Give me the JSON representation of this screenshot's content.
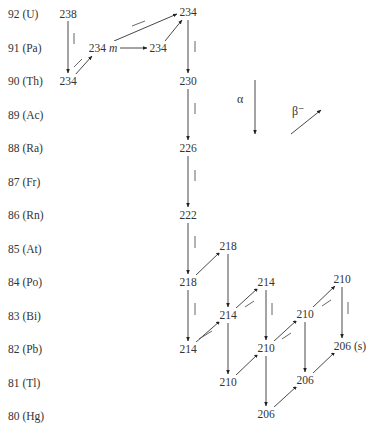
{
  "rows": [
    {
      "label": "92 (U)",
      "y": 14
    },
    {
      "label": "91 (Pa)",
      "y": 48
    },
    {
      "label": "90 (Th)",
      "y": 81
    },
    {
      "label": "89 (Ac)",
      "y": 115
    },
    {
      "label": "88 (Ra)",
      "y": 148
    },
    {
      "label": "87 (Fr)",
      "y": 182
    },
    {
      "label": "86 (Rn)",
      "y": 215
    },
    {
      "label": "85 (At)",
      "y": 249
    },
    {
      "label": "84 (Po)",
      "y": 282
    },
    {
      "label": "83 (Bi)",
      "y": 316
    },
    {
      "label": "82 (Pb)",
      "y": 349
    },
    {
      "label": "81 (Tl)",
      "y": 383
    },
    {
      "label": "80 (Hg)",
      "y": 416
    }
  ],
  "nodes": {
    "u238": {
      "label": "238",
      "x": 68,
      "y": 14
    },
    "th234": {
      "label": "234",
      "x": 68,
      "y": 81
    },
    "pa234m": {
      "label": "234 m",
      "x": 103,
      "y": 48
    },
    "pa234": {
      "label": "234",
      "x": 158,
      "y": 48
    },
    "u234": {
      "label": "234",
      "x": 188,
      "y": 12
    },
    "th230": {
      "label": "230",
      "x": 188,
      "y": 81
    },
    "ra226": {
      "label": "226",
      "x": 188,
      "y": 148
    },
    "rn222": {
      "label": "222",
      "x": 188,
      "y": 215
    },
    "po218": {
      "label": "218",
      "x": 188,
      "y": 282
    },
    "at218": {
      "label": "218",
      "x": 228,
      "y": 246
    },
    "pb214": {
      "label": "214",
      "x": 188,
      "y": 349
    },
    "bi214": {
      "label": "214",
      "x": 228,
      "y": 315
    },
    "po214": {
      "label": "214",
      "x": 266,
      "y": 282
    },
    "tl210": {
      "label": "210",
      "x": 228,
      "y": 382
    },
    "pb210": {
      "label": "210",
      "x": 266,
      "y": 348
    },
    "bi210": {
      "label": "210",
      "x": 305,
      "y": 314
    },
    "po210": {
      "label": "210",
      "x": 342,
      "y": 279
    },
    "hg206": {
      "label": "206",
      "x": 266,
      "y": 414
    },
    "tl206": {
      "label": "206",
      "x": 305,
      "y": 380
    },
    "pb206": {
      "label": "206 (s)",
      "x": 350,
      "y": 346
    }
  },
  "legend": {
    "alpha_label": "α",
    "beta_label": "β⁻"
  },
  "decay_types": {
    "alpha": "vertical down arrow (Z−2, A−4)",
    "beta_minus": "diagonal up-right arrow (Z+1)"
  }
}
